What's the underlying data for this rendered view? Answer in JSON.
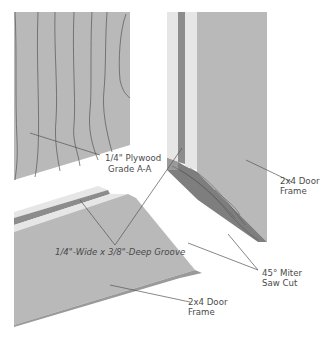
{
  "colors": {
    "background": "#ffffff",
    "panel_face": "#b9b9b9",
    "light_edge": "#e6e6e6",
    "groove": "#8c8c8c",
    "miter_end": "#7e7e7e",
    "grain_line": "#555555",
    "leader_line": "#555555",
    "text": "#4a4a4a"
  },
  "labels": {
    "plywood": {
      "line1": "1/4\" Plywood",
      "line2": "Grade A-A"
    },
    "door_frame_vertical": {
      "line1": "2x4 Door",
      "line2": "Frame"
    },
    "groove": {
      "text": "1/4\"-Wide x 3/8\"-Deep Groove"
    },
    "miter": {
      "line1": "45° Miter",
      "line2": "Saw Cut"
    },
    "door_frame_horizontal": {
      "line1": "2x4 Door",
      "line2": "Frame"
    }
  }
}
